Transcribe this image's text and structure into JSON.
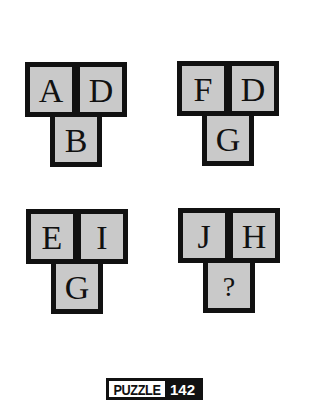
{
  "puzzle": {
    "groups": [
      {
        "top_left": "A",
        "top_right": "D",
        "bottom": "B"
      },
      {
        "top_left": "F",
        "top_right": "D",
        "bottom": "G"
      },
      {
        "top_left": "E",
        "top_right": "I",
        "bottom": "G"
      },
      {
        "top_left": "J",
        "top_right": "H",
        "bottom": "?"
      }
    ],
    "colors": {
      "tile_fill": "#c9c9c9",
      "tile_border": "#111111",
      "background": "#ffffff"
    }
  },
  "badge": {
    "label": "PUZZLE",
    "number": "142"
  }
}
